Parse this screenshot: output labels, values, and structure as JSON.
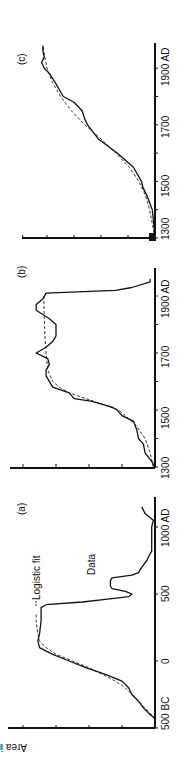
{
  "chart_data": [
    {
      "panel": "(a)",
      "type": "line",
      "title": "(a)",
      "xlabel": "",
      "ylabel": "Area in sq. miles × 10²",
      "x_ticks": [
        "500 BC",
        "0",
        "500",
        "1000 AD"
      ],
      "x_range": [
        -500,
        1200
      ],
      "annotations": [
        "Logistic fit",
        "Data"
      ],
      "series": [
        {
          "name": "Data",
          "style": "solid",
          "x": [
            -430,
            -400,
            -350,
            -300,
            -250,
            -200,
            -150,
            -100,
            -50,
            0,
            50,
            100,
            150,
            200,
            300,
            400,
            420,
            440,
            460,
            480,
            500,
            520,
            540,
            560,
            600,
            620,
            640,
            660,
            700,
            750,
            800,
            820,
            1000,
            1050,
            1100,
            1150
          ],
          "y": [
            0,
            0.15,
            0.35,
            0.5,
            0.7,
            0.8,
            1.0,
            1.5,
            2.1,
            2.6,
            3.1,
            3.5,
            3.55,
            3.5,
            3.45,
            3.45,
            3.3,
            2.2,
            1.5,
            0.8,
            0.7,
            0.9,
            1.3,
            1.35,
            1.35,
            1.3,
            0.7,
            0.5,
            0.4,
            0.25,
            0.15,
            0.1,
            0.1,
            0.05,
            0.3,
            0.4
          ]
        },
        {
          "name": "Logistic fit",
          "style": "dashed",
          "x": [
            -430,
            -350,
            -300,
            -250,
            -200,
            -150,
            -100,
            -50,
            0,
            50,
            100,
            150,
            200,
            250,
            300,
            350
          ],
          "y": [
            0,
            0.3,
            0.5,
            0.7,
            0.9,
            1.2,
            1.6,
            2.0,
            2.5,
            3.0,
            3.3,
            3.5,
            3.55,
            3.58,
            3.6,
            3.6
          ]
        }
      ]
    },
    {
      "panel": "(b)",
      "type": "line",
      "title": "(b)",
      "x_ticks": [
        "1300",
        "1500",
        "1700",
        "1900 AD"
      ],
      "x_range": [
        1300,
        1990
      ],
      "series": [
        {
          "name": "Data",
          "style": "solid",
          "x": [
            1300,
            1320,
            1350,
            1380,
            1400,
            1430,
            1460,
            1480,
            1500,
            1510,
            1530,
            1540,
            1560,
            1580,
            1620,
            1640,
            1660,
            1680,
            1700,
            1720,
            1740,
            1760,
            1800,
            1820,
            1850,
            1870,
            1890,
            1910,
            1920,
            1930,
            1950,
            1960
          ],
          "y": [
            0,
            0.1,
            0.3,
            0.35,
            0.5,
            0.55,
            0.65,
            1.0,
            1.15,
            1.3,
            1.9,
            2.45,
            2.6,
            3.1,
            3.3,
            3.3,
            3.2,
            3.25,
            3.6,
            3.3,
            3.1,
            3.0,
            3.0,
            3.2,
            3.6,
            3.6,
            3.4,
            3.3,
            1.2,
            0.7,
            0.15,
            0.15
          ]
        },
        {
          "name": "Logistic fit",
          "style": "dashed",
          "x": [
            1300,
            1350,
            1400,
            1450,
            1500,
            1520,
            1540,
            1560,
            1580,
            1600,
            1640,
            1700,
            1750,
            1800,
            1850,
            1900
          ],
          "y": [
            0.05,
            0.15,
            0.3,
            0.6,
            1.1,
            1.6,
            2.1,
            2.6,
            2.9,
            3.1,
            3.25,
            3.3,
            3.33,
            3.35,
            3.36,
            3.37
          ]
        }
      ]
    },
    {
      "panel": "(c)",
      "type": "line",
      "title": "(c)",
      "x_ticks": [
        "1300",
        "1500",
        "1700",
        "1900 AD"
      ],
      "x_range": [
        1300,
        1990
      ],
      "series": [
        {
          "name": "Data",
          "style": "solid",
          "x": [
            1300,
            1350,
            1400,
            1450,
            1480,
            1500,
            1550,
            1600,
            1650,
            1700,
            1720,
            1750,
            1780,
            1800,
            1850,
            1880,
            1900,
            1920,
            1940,
            1960,
            1980
          ],
          "y": [
            0,
            0.05,
            0.1,
            0.3,
            0.45,
            0.5,
            0.8,
            1.4,
            2.1,
            2.5,
            2.6,
            2.7,
            3.0,
            3.4,
            3.7,
            3.9,
            4.1,
            4.2,
            4.1,
            4.15,
            4.15
          ]
        },
        {
          "name": "Logistic fit",
          "style": "dashed",
          "x": [
            1300,
            1350,
            1400,
            1450,
            1500,
            1550,
            1600,
            1650,
            1700,
            1750,
            1800,
            1850,
            1900,
            1950,
            1980
          ],
          "y": [
            0,
            0.1,
            0.2,
            0.35,
            0.6,
            0.95,
            1.45,
            2.0,
            2.6,
            3.1,
            3.5,
            3.8,
            4.0,
            4.1,
            4.15
          ]
        }
      ]
    }
  ],
  "panels": {
    "a": {
      "label": "(a)",
      "ticks": [
        "500 BC",
        "0",
        "500",
        "1000 AD"
      ],
      "fit_label": "Logistic fit",
      "data_label": "Data"
    },
    "b": {
      "label": "(b)",
      "ticks": [
        "1300",
        "1500",
        "1700",
        "1900 AD"
      ]
    },
    "c": {
      "label": "(c)",
      "ticks": [
        "1300",
        "1500",
        "1700",
        "1900 AD"
      ]
    }
  },
  "ylabel": "Area in sq. miles × 10²"
}
